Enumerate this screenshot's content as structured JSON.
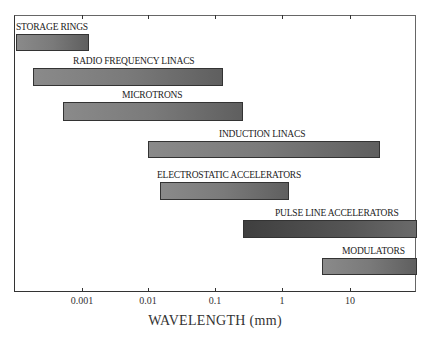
{
  "chart_data": {
    "type": "bar",
    "orientation": "horizontal-range",
    "title": "",
    "xlabel": "WAVELENGTH (mm)",
    "ylabel": "",
    "xscale": "log",
    "xlim": [
      0.0001,
      100
    ],
    "x_ticks": [
      "0.001",
      "0.01",
      "0.1",
      "1",
      "10"
    ],
    "grid": false,
    "legend": null,
    "categories": [
      "STORAGE RINGS",
      "RADIO FREQUENCY LINACS",
      "MICROTRONS",
      "INDUCTION LINACS",
      "ELECTROSTATIC ACCELERATORS",
      "PULSE LINE ACCELERATORS",
      "MODULATORS"
    ],
    "ranges": [
      {
        "name": "STORAGE RINGS",
        "min": 0.0001,
        "max": 0.0013
      },
      {
        "name": "RADIO FREQUENCY LINACS",
        "min": 0.0002,
        "max": 0.13
      },
      {
        "name": "MICROTRONS",
        "min": 0.0006,
        "max": 0.26
      },
      {
        "name": "INDUCTION LINACS",
        "min": 0.01,
        "max": 28
      },
      {
        "name": "ELECTROSTATIC ACCELERATORS",
        "min": 0.015,
        "max": 1.2
      },
      {
        "name": "PULSE LINE ACCELERATORS",
        "min": 0.26,
        "max": 100
      },
      {
        "name": "MODULATORS",
        "min": 4,
        "max": 100
      }
    ]
  },
  "bars": [
    {
      "label": "STORAGE RINGS",
      "x": 16,
      "w": 73,
      "y": 34,
      "h": 17,
      "lx": 16,
      "ly": 22,
      "dark": false
    },
    {
      "label": "RADIO FREQUENCY LINACS",
      "x": 33,
      "w": 190,
      "y": 68,
      "h": 18,
      "lx": 73,
      "ly": 56,
      "dark": false
    },
    {
      "label": "MICROTRONS",
      "x": 63,
      "w": 180,
      "y": 102,
      "h": 19,
      "lx": 122,
      "ly": 90,
      "dark": false
    },
    {
      "label": "INDUCTION LINACS",
      "x": 148,
      "w": 232,
      "y": 141,
      "h": 17,
      "lx": 219,
      "ly": 129,
      "dark": false
    },
    {
      "label": "ELECTROSTATIC ACCELERATORS",
      "x": 160,
      "w": 129,
      "y": 182,
      "h": 18,
      "lx": 157,
      "ly": 170,
      "dark": false
    },
    {
      "label": "PULSE LINE ACCELERATORS",
      "x": 243,
      "w": 174,
      "y": 220,
      "h": 18,
      "lx": 275,
      "ly": 208,
      "dark": true
    },
    {
      "label": "MODULATORS",
      "x": 322,
      "w": 95,
      "y": 258,
      "h": 17,
      "lx": 342,
      "ly": 246,
      "dark": false
    }
  ],
  "ticks": [
    {
      "label": "0.001",
      "x": 82
    },
    {
      "label": "0.01",
      "x": 148
    },
    {
      "label": "0.1",
      "x": 215
    },
    {
      "label": "1",
      "x": 282
    },
    {
      "label": "10",
      "x": 350
    }
  ]
}
